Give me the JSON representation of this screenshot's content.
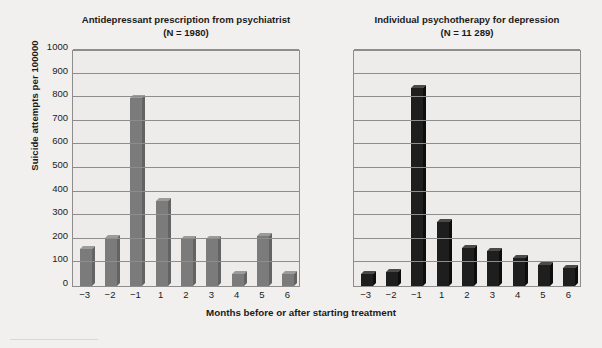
{
  "axis": {
    "y_title": "Suicide attempts per 100000",
    "x_title": "Months before or after starting treatment",
    "y_ticks": [
      "1000",
      "900",
      "800",
      "700",
      "600",
      "500",
      "400",
      "300",
      "200",
      "100",
      "0"
    ],
    "x_ticks": [
      "−3",
      "−2",
      "−1",
      "1",
      "2",
      "3",
      "4",
      "5",
      "6"
    ]
  },
  "panels": [
    {
      "title_line1": "Antidepressant prescription from psychiatrist",
      "title_line2": "(N = 1980)",
      "bar_color": "#7b7b7b",
      "bar_top_color": "#9b9b9b",
      "bar_side_color": "#636363"
    },
    {
      "title_line1": "Individual psychotherapy for depression",
      "title_line2": "(N = 11 289)",
      "bar_color": "#1e1e1e",
      "bar_top_color": "#4a4a4a",
      "bar_side_color": "#0d0d0d"
    }
  ],
  "colors": {
    "figure_background": "#f1f0ee",
    "panel_background": "#edecea",
    "gridline": "#8d8d8d",
    "text": "#1b1b1b"
  },
  "chart_data": {
    "type": "bar",
    "xlabel": "Months before or after starting treatment",
    "ylabel": "Suicide attempts per 100000",
    "ylim": [
      0,
      1000
    ],
    "ytick_step": 100,
    "grid": true,
    "legend": "none",
    "categories": [
      "-3",
      "-2",
      "-1",
      "1",
      "2",
      "3",
      "4",
      "5",
      "6"
    ],
    "panels": [
      {
        "name": "Antidepressant prescription from psychiatrist",
        "n": 1980,
        "values": [
          155,
          205,
          795,
          360,
          200,
          200,
          50,
          210,
          50
        ]
      },
      {
        "name": "Individual psychotherapy for depression",
        "n": 11289,
        "values": [
          50,
          60,
          840,
          270,
          160,
          150,
          120,
          90,
          75
        ]
      }
    ]
  }
}
